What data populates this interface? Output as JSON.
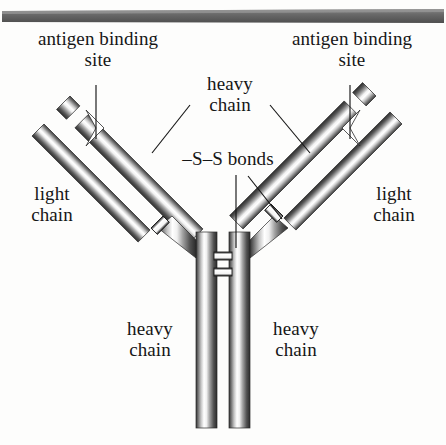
{
  "figure": {
    "background_color": "#fdfdfc",
    "ink_color": "#161616",
    "top_bar_color": "#6f6f6f"
  },
  "labels": {
    "antigen_binding_site_left": "antigen binding\nsite",
    "antigen_binding_site_right": "antigen binding\nsite",
    "heavy_chain_top": "heavy\nchain",
    "ss_bonds": "–S–S bonds",
    "light_chain_left": "light\nchain",
    "light_chain_right": "light\nchain",
    "heavy_chain_bottom_left": "heavy\nchain",
    "heavy_chain_bottom_right": "heavy\nchain"
  },
  "parts": {
    "top_bar": "decorative-rule",
    "left_heavy_arm": "heavy-chain-arm-left",
    "right_heavy_arm": "heavy-chain-arm-right",
    "left_light_arm": "light-chain-arm-left",
    "right_light_arm": "light-chain-arm-right",
    "left_stem": "heavy-chain-stem-left",
    "right_stem": "heavy-chain-stem-right",
    "hinge_bond_upper": "disulfide-bridge-hinge-upper",
    "hinge_bond_lower": "disulfide-bridge-hinge-lower",
    "left_arm_bond": "disulfide-bridge-arm-left",
    "right_arm_bond": "disulfide-bridge-arm-right",
    "left_notch": "antigen-binding-notch-left",
    "right_notch": "antigen-binding-notch-right"
  },
  "leaders": {
    "antigen_left": "leader-line-antigen-left",
    "antigen_right": "leader-line-antigen-right",
    "heavy_top_left": "leader-line-heavy-chain-left",
    "heavy_top_right": "leader-line-heavy-chain-right",
    "ss_center": "leader-line-ss-bonds-center",
    "ss_right": "leader-line-ss-bonds-right"
  }
}
